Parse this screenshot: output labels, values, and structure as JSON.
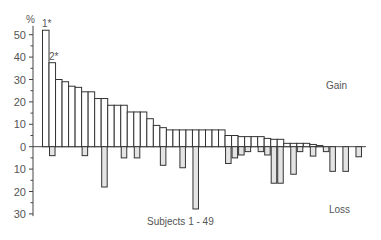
{
  "chart_data": {
    "type": "bar",
    "title": "",
    "xlabel": "Subjects 1 - 49",
    "ylabel": "%",
    "ylim": [
      -30,
      55
    ],
    "y_ticks_gain": [
      0,
      10,
      20,
      30,
      40,
      50
    ],
    "y_ticks_loss": [
      10,
      20,
      30
    ],
    "grid": false,
    "annotations": [
      {
        "text": "1*",
        "bar": 1
      },
      {
        "text": "2*",
        "bar": 2
      },
      {
        "text": "Gain",
        "position": "right-upper"
      },
      {
        "text": "Loss",
        "position": "right-lower"
      }
    ],
    "categories": [
      1,
      2,
      3,
      4,
      5,
      6,
      7,
      8,
      9,
      10,
      11,
      12,
      13,
      14,
      15,
      16,
      17,
      18,
      19,
      20,
      21,
      22,
      23,
      24,
      25,
      26,
      27,
      28,
      29,
      30,
      31,
      32,
      33,
      34,
      35,
      36,
      37,
      38,
      39,
      40,
      41,
      42,
      43,
      44,
      45,
      46,
      47,
      48,
      49
    ],
    "series": [
      {
        "name": "Gain",
        "color": "#ffffff",
        "values": [
          52,
          37.5,
          30,
          29,
          27,
          26.5,
          24.5,
          24.5,
          21.5,
          21.5,
          18.5,
          18.5,
          18.5,
          15.5,
          15.5,
          15.5,
          12.5,
          9.5,
          8.5,
          7.5,
          7.5,
          7.5,
          7.5,
          7.5,
          7.5,
          7.5,
          7.5,
          7.5,
          5,
          5,
          4.5,
          4.5,
          4.5,
          4.5,
          3.7,
          3.3,
          3.3,
          1.5,
          1.5,
          1.5,
          1.5,
          1,
          0.5,
          0,
          0,
          0,
          0,
          0,
          0
        ]
      },
      {
        "name": "Loss",
        "color": "#e4e4e4",
        "values": [
          0,
          4,
          0,
          0,
          0,
          0,
          4,
          0,
          0,
          18,
          0,
          0,
          5,
          0,
          5,
          0,
          0,
          0,
          8.3,
          0,
          0,
          9.4,
          0,
          27.8,
          0,
          0,
          0,
          0,
          7.5,
          5,
          3.7,
          2.2,
          0,
          2.2,
          3.7,
          16.3,
          16.3,
          0,
          12.3,
          2.2,
          0,
          4.2,
          0,
          2.2,
          11,
          0,
          11,
          0,
          4.5
        ]
      }
    ]
  },
  "labels": {
    "y_unit": "%",
    "bar1_note": "1*",
    "bar2_note": "2*",
    "gain": "Gain",
    "loss": "Loss",
    "x_axis": "Subjects 1 - 49"
  }
}
